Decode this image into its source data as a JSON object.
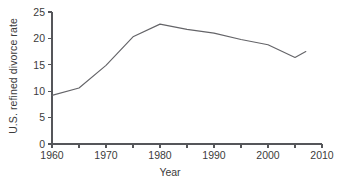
{
  "chart_data": {
    "type": "line",
    "title": "",
    "xlabel": "Year",
    "ylabel": "U.S. refined divorce rate",
    "xlim": [
      1960,
      2010
    ],
    "ylim": [
      0,
      25
    ],
    "grid": false,
    "legend": null,
    "legend_position": "none",
    "line_color": "#646468",
    "axis_color": "#55565a",
    "text_color": "#3b3b3b",
    "background_color": "#ffffff",
    "x_ticks": [
      1960,
      1965,
      1970,
      1975,
      1980,
      1985,
      1990,
      1995,
      2000,
      2005,
      2010
    ],
    "x_tick_labels": [
      "1960",
      "",
      "1970",
      "",
      "1980",
      "",
      "1990",
      "",
      "2000",
      "",
      "2010"
    ],
    "y_ticks": [
      0,
      5,
      10,
      15,
      20,
      25
    ],
    "y_tick_labels": [
      "0",
      "5",
      "10",
      "15",
      "20",
      "25"
    ],
    "x": [
      1960,
      1965,
      1970,
      1975,
      1980,
      1985,
      1990,
      1995,
      2000,
      2005,
      2007
    ],
    "values": [
      9.2,
      10.6,
      14.9,
      20.3,
      22.7,
      21.7,
      21.0,
      19.8,
      18.8,
      16.4,
      17.5
    ],
    "series": [
      {
        "name": "U.S. refined divorce rate",
        "x": [
          1960,
          1965,
          1970,
          1975,
          1980,
          1985,
          1990,
          1995,
          2000,
          2005,
          2007
        ],
        "values": [
          9.2,
          10.6,
          14.9,
          20.3,
          22.7,
          21.7,
          21.0,
          19.8,
          18.8,
          16.4,
          17.5
        ]
      }
    ],
    "annotations": []
  }
}
